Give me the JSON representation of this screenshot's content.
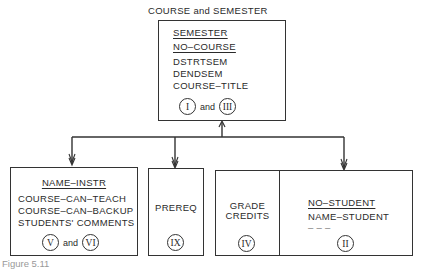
{
  "diagram": {
    "top_title": "COURSE and SEMESTER",
    "top_box": {
      "key1": "SEMESTER",
      "key2": "NO–COURSE",
      "fields": [
        "DSTRTSEM",
        "DENDSEM",
        "COURSE–TITLE"
      ],
      "refs": [
        "I",
        "III"
      ],
      "and": "and"
    },
    "instr_box": {
      "key": "NAME–INSTR",
      "fields": [
        "COURSE–CAN–TEACH",
        "COURSE–CAN–BACKUP",
        "STUDENTS' COMMENTS"
      ],
      "refs": [
        "V",
        "VI"
      ],
      "and": "and"
    },
    "prereq_box": {
      "label": "PREREQ",
      "ref": "IX"
    },
    "grade_box": {
      "fields": [
        "GRADE",
        "CREDITS"
      ],
      "ref": "IV"
    },
    "student_box": {
      "key": "NO–STUDENT",
      "fields": [
        "NAME–STUDENT",
        "– – –"
      ],
      "ref": "II"
    },
    "caption": "Figure 5.11"
  }
}
